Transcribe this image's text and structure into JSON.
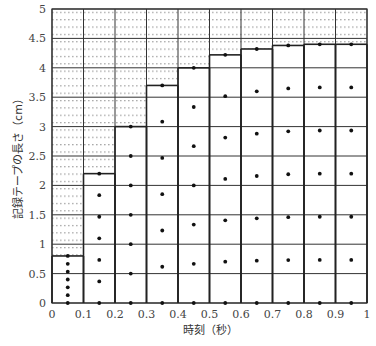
{
  "chart_data": {
    "type": "bar",
    "subtype": "tape-strip chart (ticker tape segments with dots)",
    "title": "",
    "xlabel": "時刻（秒）",
    "ylabel": "記録テープの長さ（cm）",
    "xlim": [
      0,
      1
    ],
    "ylim": [
      0,
      5
    ],
    "x_ticks": [
      "0",
      "0.1",
      "0.2",
      "0.3",
      "0.4",
      "0.5",
      "0.6",
      "0.7",
      "0.8",
      "0.9",
      "1"
    ],
    "y_ticks": [
      "0",
      "0.5",
      "1",
      "1.5",
      "2",
      "2.5",
      "3",
      "3.5",
      "4",
      "4.5",
      "5"
    ],
    "grid": true,
    "categories": [
      "0-0.1",
      "0.1-0.2",
      "0.2-0.3",
      "0.3-0.4",
      "0.4-0.5",
      "0.5-0.6",
      "0.6-0.7",
      "0.7-0.8",
      "0.8-0.9",
      "0.9-1.0"
    ],
    "values": [
      0.8,
      2.2,
      3.0,
      3.7,
      4.0,
      4.22,
      4.32,
      4.38,
      4.4,
      4.4
    ],
    "dots_per_strip": 7
  },
  "colors": {
    "background": "#ffffff",
    "grid": "#333333",
    "dot": "#111111",
    "hatch": "#888888",
    "text": "#444444"
  }
}
